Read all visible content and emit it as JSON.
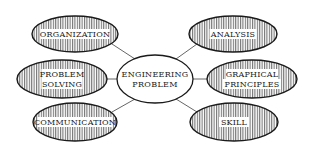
{
  "diagram": {
    "type": "mind-map",
    "center": {
      "lines": [
        "ENGINEERING",
        "PROBLEM"
      ],
      "cx": 155,
      "cy": 79,
      "rx": 38,
      "ry": 24
    },
    "nodes": [
      {
        "id": "organization",
        "lines": [
          "ORGANIZATION"
        ],
        "cx": 75,
        "cy": 34,
        "rx": 43,
        "ry": 18
      },
      {
        "id": "problem-solving",
        "lines": [
          "PROBLEM",
          "SOLVING"
        ],
        "cx": 62,
        "cy": 79,
        "rx": 45,
        "ry": 19
      },
      {
        "id": "communication",
        "lines": [
          "COMMUNICATION"
        ],
        "cx": 75,
        "cy": 122,
        "rx": 42,
        "ry": 19
      },
      {
        "id": "analysis",
        "lines": [
          "ANALYSIS"
        ],
        "cx": 233,
        "cy": 34,
        "rx": 44,
        "ry": 18
      },
      {
        "id": "graphical-principles",
        "lines": [
          "GRAPHICAL",
          "PRINCIPLES"
        ],
        "cx": 252,
        "cy": 79,
        "rx": 45,
        "ry": 19
      },
      {
        "id": "skill",
        "lines": [
          "SKILL"
        ],
        "cx": 234,
        "cy": 122,
        "rx": 44,
        "ry": 19
      }
    ],
    "connectors": [
      {
        "from": "center",
        "to": "organization",
        "x1": 135,
        "y1": 59,
        "x2": 112,
        "y2": 44
      },
      {
        "from": "center",
        "to": "problem-solving",
        "x1": 117,
        "y1": 79,
        "x2": 107,
        "y2": 79
      },
      {
        "from": "center",
        "to": "communication",
        "x1": 135,
        "y1": 99,
        "x2": 112,
        "y2": 112
      },
      {
        "from": "center",
        "to": "analysis",
        "x1": 176,
        "y1": 59,
        "x2": 197,
        "y2": 44
      },
      {
        "from": "center",
        "to": "graphical-principles",
        "x1": 193,
        "y1": 79,
        "x2": 207,
        "y2": 79
      },
      {
        "from": "center",
        "to": "skill",
        "x1": 176,
        "y1": 99,
        "x2": 197,
        "y2": 112
      }
    ],
    "colors": {
      "stroke": "#1a1a1a",
      "hatch": "#2a2a2a",
      "connector": "#555555",
      "background": "#ffffff"
    }
  }
}
